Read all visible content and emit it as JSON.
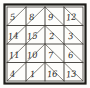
{
  "figure": {
    "name": "magic-square",
    "ink_color": "#26251f",
    "background_color": "#fdfdfb",
    "frame": {
      "outer_border_color": "#1c1b17",
      "inner_border_color": "#3a3833"
    }
  },
  "chart_data": {
    "type": "table",
    "title": "",
    "xlabel": "",
    "ylabel": "",
    "rows": 4,
    "columns": 4,
    "grid": true,
    "legend": "none",
    "magic_constant": 34,
    "values": [
      [
        5,
        8,
        9,
        12
      ],
      [
        14,
        15,
        2,
        3
      ],
      [
        11,
        10,
        7,
        6
      ],
      [
        4,
        1,
        16,
        13
      ]
    ],
    "row_labels": [
      "row-1",
      "row-2",
      "row-3",
      "row-4"
    ],
    "column_labels": [
      "col-1",
      "col-2",
      "col-3",
      "col-4"
    ],
    "row_sums": [
      34,
      34,
      34,
      34
    ],
    "column_sums": [
      34,
      34,
      34,
      34
    ],
    "diagonal_sums": [
      34,
      34
    ]
  },
  "cells": [
    {
      "id": "cell-r1c1",
      "row": 1,
      "col": 1,
      "value": "5",
      "x": 10,
      "y": 13,
      "rot": -6
    },
    {
      "id": "cell-r1c2",
      "row": 1,
      "col": 2,
      "value": "8",
      "x": 29,
      "y": 13,
      "rot": -5
    },
    {
      "id": "cell-r1c3",
      "row": 1,
      "col": 3,
      "value": "9",
      "x": 48,
      "y": 13,
      "rot": -4
    },
    {
      "id": "cell-r1c4",
      "row": 1,
      "col": 4,
      "value": "12",
      "x": 66,
      "y": 13,
      "rot": -5
    },
    {
      "id": "cell-r2c1",
      "row": 2,
      "col": 1,
      "value": "14",
      "x": 8,
      "y": 32,
      "rot": -6
    },
    {
      "id": "cell-r2c2",
      "row": 2,
      "col": 2,
      "value": "15",
      "x": 27,
      "y": 32,
      "rot": -6
    },
    {
      "id": "cell-r2c3",
      "row": 2,
      "col": 3,
      "value": "2",
      "x": 49,
      "y": 32,
      "rot": -4
    },
    {
      "id": "cell-r2c4",
      "row": 2,
      "col": 4,
      "value": "3",
      "x": 68,
      "y": 32,
      "rot": -5
    },
    {
      "id": "cell-r3c1",
      "row": 3,
      "col": 1,
      "value": "11",
      "x": 9,
      "y": 51,
      "rot": -6
    },
    {
      "id": "cell-r3c2",
      "row": 3,
      "col": 2,
      "value": "10",
      "x": 27,
      "y": 51,
      "rot": -6
    },
    {
      "id": "cell-r3c3",
      "row": 3,
      "col": 3,
      "value": "7",
      "x": 48,
      "y": 51,
      "rot": -4
    },
    {
      "id": "cell-r3c4",
      "row": 3,
      "col": 4,
      "value": "6",
      "x": 68,
      "y": 51,
      "rot": -5
    },
    {
      "id": "cell-r4c1",
      "row": 4,
      "col": 1,
      "value": "4",
      "x": 10,
      "y": 70,
      "rot": -6
    },
    {
      "id": "cell-r4c2",
      "row": 4,
      "col": 2,
      "value": "1",
      "x": 30,
      "y": 70,
      "rot": -5
    },
    {
      "id": "cell-r4c3",
      "row": 4,
      "col": 3,
      "value": "16",
      "x": 47,
      "y": 70,
      "rot": -4
    },
    {
      "id": "cell-r4c4",
      "row": 4,
      "col": 4,
      "value": "13",
      "x": 66,
      "y": 70,
      "rot": -5
    }
  ]
}
